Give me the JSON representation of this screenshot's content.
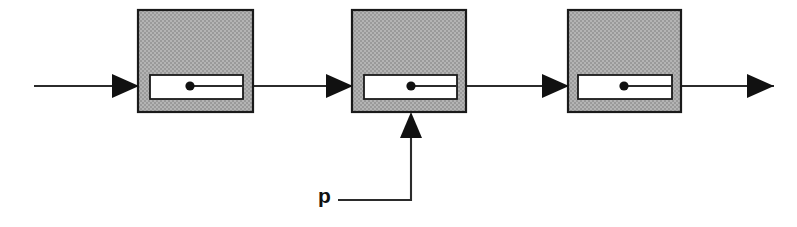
{
  "figure": {
    "kind": "block-diagram",
    "canvas": {
      "width": 797,
      "height": 227,
      "background": "#ffffff"
    },
    "colors": {
      "stage_fill": "#a8a8a8",
      "stage_stroke": "#1a1a1a",
      "window_fill": "#ffffff",
      "window_stroke": "#1a1a1a",
      "line": "#2b2b2b",
      "dot": "#111111",
      "label": "#111111"
    }
  },
  "stages": [
    {
      "id": "stage-1",
      "name": "stage-block-1",
      "box": {
        "x": 138,
        "y": 10,
        "width": 115,
        "height": 102
      },
      "window": {
        "x": 150,
        "y": 75,
        "width": 93,
        "height": 24
      },
      "dot": {
        "cx": 190,
        "cy": 86,
        "r": 4.6
      },
      "internal_line": {
        "x1": 190,
        "y1": 86,
        "x2": 243,
        "y2": 86
      }
    },
    {
      "id": "stage-2",
      "name": "stage-block-2",
      "box": {
        "x": 352,
        "y": 10,
        "width": 114,
        "height": 102
      },
      "window": {
        "x": 364,
        "y": 75,
        "width": 93,
        "height": 24
      },
      "dot": {
        "cx": 411,
        "cy": 86,
        "r": 4.6
      },
      "internal_line": {
        "x1": 411,
        "y1": 86,
        "x2": 457,
        "y2": 86
      }
    },
    {
      "id": "stage-3",
      "name": "stage-block-3",
      "box": {
        "x": 568,
        "y": 10,
        "width": 113,
        "height": 102
      },
      "window": {
        "x": 578,
        "y": 75,
        "width": 94,
        "height": 24
      },
      "dot": {
        "cx": 624,
        "cy": 86,
        "r": 4.6
      },
      "internal_line": {
        "x1": 624,
        "y1": 86,
        "x2": 672,
        "y2": 86
      }
    }
  ],
  "signal_path": {
    "baseline_y": 86,
    "segments": [
      {
        "id": "seg-input",
        "name": "input-signal-line",
        "x1": 34,
        "x2": 140
      },
      {
        "id": "seg-1-2",
        "name": "interstage-line-1-2",
        "x1": 243,
        "x2": 354
      },
      {
        "id": "seg-2-3",
        "name": "interstage-line-2-3",
        "x1": 457,
        "x2": 570
      },
      {
        "id": "seg-output",
        "name": "output-signal-line",
        "x1": 672,
        "x2": 774
      }
    ],
    "arrowheads": [
      {
        "id": "arrow-into-stage-1",
        "name": "arrowhead-into-stage-1",
        "tip_x": 139,
        "tip_y": 86,
        "direction": "right"
      },
      {
        "id": "arrow-into-stage-2",
        "name": "arrowhead-into-stage-2",
        "tip_x": 353,
        "tip_y": 86,
        "direction": "right"
      },
      {
        "id": "arrow-into-stage-3",
        "name": "arrowhead-into-stage-3",
        "tip_x": 569,
        "tip_y": 86,
        "direction": "right"
      },
      {
        "id": "arrow-output",
        "name": "arrowhead-output",
        "tip_x": 774,
        "tip_y": 86,
        "direction": "right"
      }
    ]
  },
  "control_input": {
    "label": "p",
    "label_position": {
      "x": 318,
      "y": 203
    },
    "path": "M 338 200 L 411 200 L 411 133",
    "arrowhead": {
      "tip_x": 411,
      "tip_y": 112,
      "direction": "up"
    },
    "target_stage": "stage-2"
  }
}
